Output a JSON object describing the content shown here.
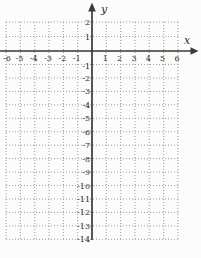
{
  "chart_data": {
    "type": "table",
    "subtype": "empty-coordinate-grid",
    "title": "",
    "xlabel": "x",
    "ylabel": "y",
    "xlim": [
      -6,
      6
    ],
    "ylim": [
      -14,
      2
    ],
    "grid": true,
    "grid_style": "dotted",
    "legend": "none",
    "series": [],
    "x_ticks": [
      {
        "value": -6,
        "label": "-6"
      },
      {
        "value": -5,
        "label": "-5"
      },
      {
        "value": -4,
        "label": "-4"
      },
      {
        "value": -3,
        "label": "-3"
      },
      {
        "value": -2,
        "label": "-2"
      },
      {
        "value": -1,
        "label": "-1"
      },
      {
        "value": 1,
        "label": "1"
      },
      {
        "value": 2,
        "label": "2"
      },
      {
        "value": 3,
        "label": "3"
      },
      {
        "value": 4,
        "label": "4"
      },
      {
        "value": 5,
        "label": "5"
      },
      {
        "value": 6,
        "label": "6"
      }
    ],
    "y_ticks": [
      {
        "value": 2,
        "label": "2"
      },
      {
        "value": 1,
        "label": "1"
      },
      {
        "value": -1,
        "label": "-1"
      },
      {
        "value": -2,
        "label": "-2"
      },
      {
        "value": -3,
        "label": "-3"
      },
      {
        "value": -4,
        "label": "-4"
      },
      {
        "value": -5,
        "label": "-5"
      },
      {
        "value": -6,
        "label": "-6"
      },
      {
        "value": -7,
        "label": "-7"
      },
      {
        "value": -8,
        "label": "-8"
      },
      {
        "value": -9,
        "label": "-9"
      },
      {
        "value": -10,
        "label": "-10"
      },
      {
        "value": -11,
        "label": "-11"
      },
      {
        "value": -12,
        "label": "-12"
      },
      {
        "value": -13,
        "label": "-13"
      },
      {
        "value": -14,
        "label": "-14"
      }
    ],
    "colors": {
      "background": "#fcfcfa",
      "grid": "#8f8f8f",
      "axis": "#3a3a3a",
      "tick_text": "#2d2d2d"
    }
  }
}
